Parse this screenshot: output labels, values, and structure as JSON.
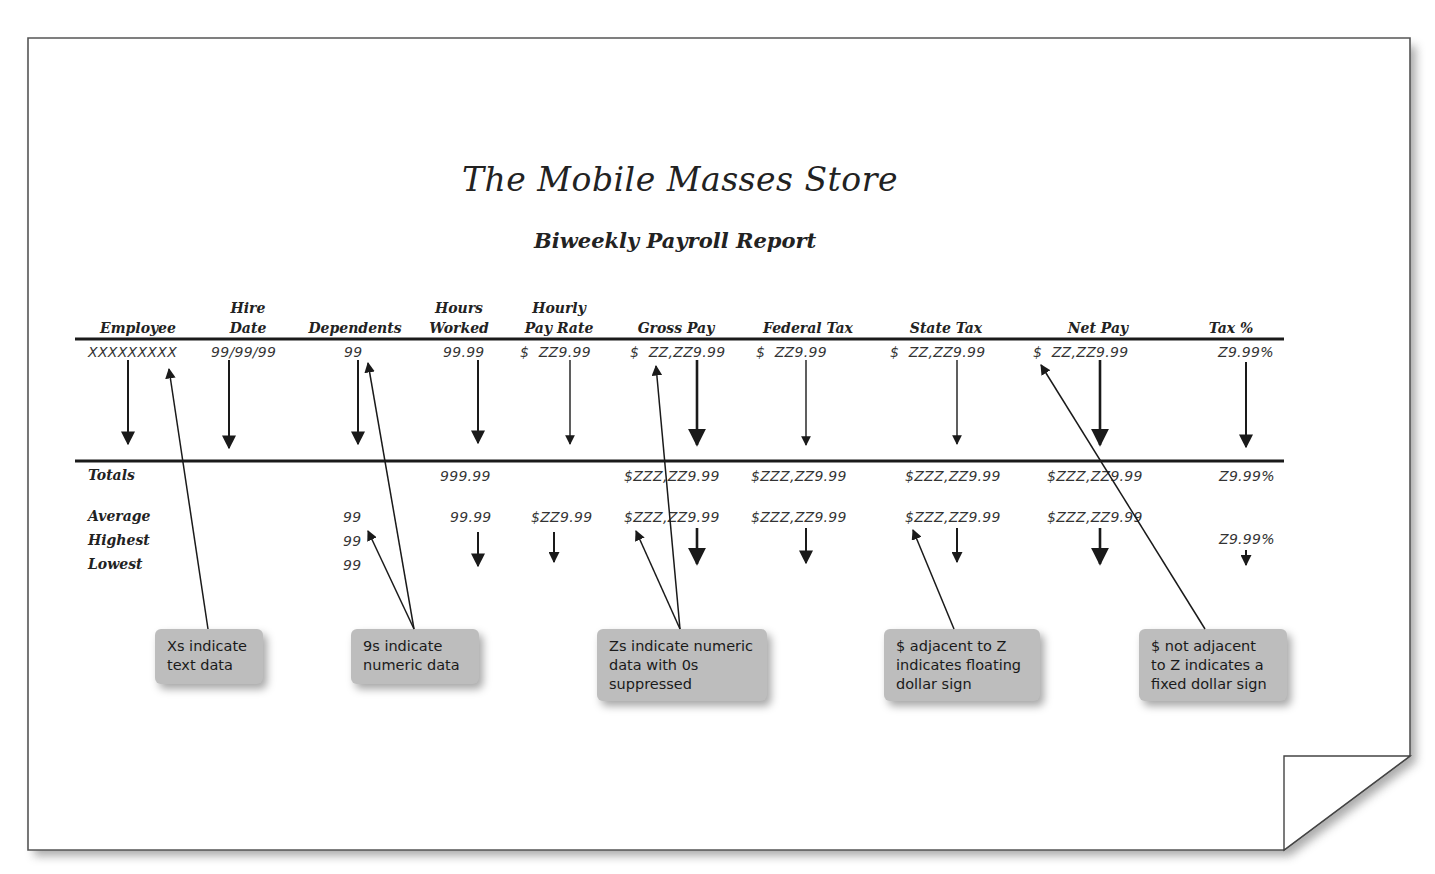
{
  "report": {
    "title": "The Mobile Masses Store",
    "subtitle": "Biweekly Payroll Report"
  },
  "columns": [
    {
      "line1": "",
      "line2": "Employee"
    },
    {
      "line1": "Hire",
      "line2": "Date"
    },
    {
      "line1": "",
      "line2": "Dependents"
    },
    {
      "line1": "Hours",
      "line2": "Worked"
    },
    {
      "line1": "Hourly",
      "line2": "Pay Rate"
    },
    {
      "line1": "",
      "line2": "Gross Pay"
    },
    {
      "line1": "",
      "line2": "Federal Tax"
    },
    {
      "line1": "",
      "line2": "State Tax"
    },
    {
      "line1": "",
      "line2": "Net Pay"
    },
    {
      "line1": "",
      "line2": "Tax %"
    }
  ],
  "detail_row": [
    "XXXXXXXXX",
    "99/99/99",
    "99",
    "99.99",
    "$  ZZ9.99",
    "$  ZZ,ZZ9.99",
    "$  ZZ9.99",
    "$  ZZ,ZZ9.99",
    "$  ZZ,ZZ9.99",
    "Z9.99%"
  ],
  "summary": {
    "totals": {
      "label": "Totals",
      "hours": "999.99",
      "gross": "$ZZZ,ZZ9.99",
      "federal": "$ZZZ,ZZ9.99",
      "state": "$ZZZ,ZZ9.99",
      "net": "$ZZZ,ZZ9.99",
      "tax_pct": "Z9.99%"
    },
    "average": {
      "label": "Average",
      "dependents": "99",
      "hours": "99.99",
      "rate": "$ZZ9.99",
      "gross": "$ZZZ,ZZ9.99",
      "federal": "$ZZZ,ZZ9.99",
      "state": "$ZZZ,ZZ9.99",
      "net": "$ZZZ,ZZ9.99"
    },
    "highest": {
      "label": "Highest",
      "dependents": "99",
      "tax_pct": "Z9.99%"
    },
    "lowest": {
      "label": "Lowest",
      "dependents": "99"
    }
  },
  "callouts": [
    {
      "text": "Xs indicate\ntext data"
    },
    {
      "text": "9s indicate\nnumeric data"
    },
    {
      "text": "Zs indicate numeric\ndata with 0s\nsuppressed"
    },
    {
      "text": "$ adjacent to Z\nindicates floating\ndollar sign"
    },
    {
      "text": "$ not adjacent\nto Z indicates a\nfixed dollar sign"
    }
  ],
  "colors": {
    "callout_fill": "#bdbdbd",
    "ink": "#1a1a1a",
    "page_border": "#555555"
  }
}
